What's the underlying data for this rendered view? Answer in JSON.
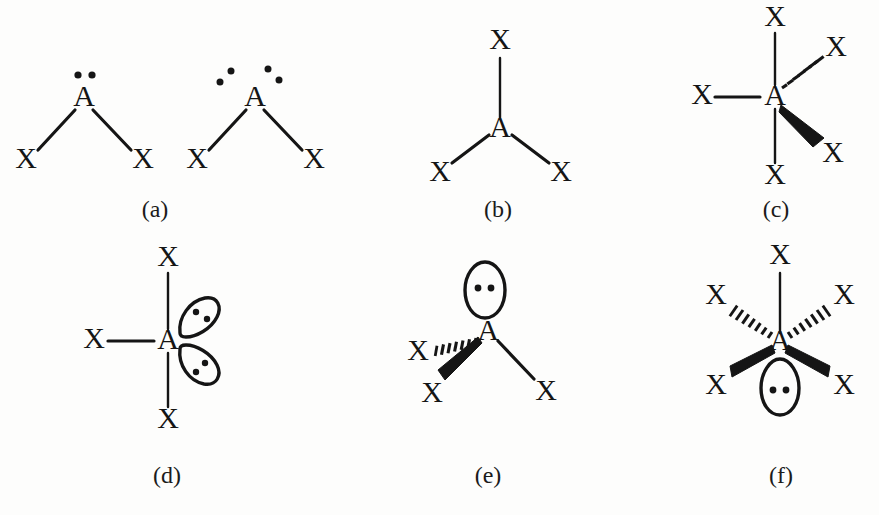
{
  "figure": {
    "background_color": "#fdfdfc",
    "ink_color": "#151515",
    "atom_center_label": "A",
    "atom_terminal_label": "X"
  },
  "panels": [
    {
      "id": "a",
      "caption": "(a)",
      "caption_x": 155,
      "caption_y": 196,
      "description": "bent AX2 geometry shown twice: one lone pair and two lone pairs",
      "structures": [
        {
          "center": "A",
          "terminals": [
            "X",
            "X"
          ],
          "lone_pairs": 1,
          "lone_pair_style": "dot-pair-above",
          "bond_styles": [
            "line",
            "line"
          ]
        },
        {
          "center": "A",
          "terminals": [
            "X",
            "X"
          ],
          "lone_pairs": 2,
          "lone_pair_style": "dot-pair-diagonal",
          "bond_styles": [
            "line",
            "line"
          ]
        }
      ]
    },
    {
      "id": "b",
      "caption": "(b)",
      "caption_x": 495,
      "caption_y": 196,
      "description": "trigonal planar AX3",
      "structures": [
        {
          "center": "A",
          "terminals": [
            "X",
            "X",
            "X"
          ],
          "lone_pairs": 0,
          "lone_pair_style": "none",
          "bond_styles": [
            "line",
            "line",
            "line"
          ]
        }
      ]
    },
    {
      "id": "c",
      "caption": "(c)",
      "caption_x": 775,
      "caption_y": 196,
      "description": "trigonal bipyramidal AX5",
      "structures": [
        {
          "center": "A",
          "terminals": [
            "X",
            "X",
            "X",
            "X",
            "X"
          ],
          "lone_pairs": 0,
          "lone_pair_style": "none",
          "bond_styles": [
            "line",
            "line",
            "line",
            "hashed-wedge",
            "solid-wedge"
          ]
        }
      ]
    },
    {
      "id": "d",
      "caption": "(d)",
      "caption_x": 150,
      "caption_y": 464,
      "description": "T-shaped AX3E2 with two lone pair lobes",
      "structures": [
        {
          "center": "A",
          "terminals": [
            "X",
            "X",
            "X"
          ],
          "lone_pairs": 2,
          "lone_pair_style": "lobe-right",
          "bond_styles": [
            "line",
            "line",
            "line"
          ]
        }
      ]
    },
    {
      "id": "e",
      "caption": "(e)",
      "caption_x": 480,
      "caption_y": 464,
      "description": "trigonal pyramidal AX3E with one lone pair lobe above",
      "structures": [
        {
          "center": "A",
          "terminals": [
            "X",
            "X",
            "X"
          ],
          "lone_pairs": 1,
          "lone_pair_style": "lobe-above",
          "bond_styles": [
            "hashed-wedge",
            "solid-wedge",
            "line"
          ]
        }
      ]
    },
    {
      "id": "f",
      "caption": "(f)",
      "caption_x": 780,
      "caption_y": 464,
      "description": "square pyramidal AX5E with one lone pair lobe below",
      "structures": [
        {
          "center": "A",
          "terminals": [
            "X",
            "X",
            "X",
            "X",
            "X"
          ],
          "lone_pairs": 1,
          "lone_pair_style": "lobe-below",
          "bond_styles": [
            "line",
            "hashed-wedge",
            "hashed-wedge",
            "solid-wedge",
            "solid-wedge"
          ]
        }
      ]
    }
  ]
}
